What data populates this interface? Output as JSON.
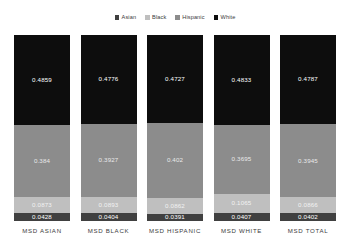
{
  "legend": {
    "position": "top-center",
    "items": [
      {
        "label": "Asian",
        "color": "#404040"
      },
      {
        "label": "Black",
        "color": "#bfbfbf"
      },
      {
        "label": "Hispanic",
        "color": "#8c8c8c"
      },
      {
        "label": "White",
        "color": "#0d0d0d"
      }
    ]
  },
  "chart_data": {
    "type": "bar",
    "subtype": "stacked-column",
    "title": "",
    "xlabel": "",
    "ylabel": "",
    "ylim": [
      0,
      1
    ],
    "grid": false,
    "stack_order_bottom_to_top": [
      "Asian",
      "Black",
      "Hispanic",
      "White"
    ],
    "categories": [
      "MSD ASIAN",
      "MSD BLACK",
      "MSD HISPANIC",
      "MSD WHITE",
      "MSD TOTAL"
    ],
    "series": [
      {
        "name": "White",
        "color": "#0d0d0d",
        "values": [
          0.4859,
          0.4776,
          0.4727,
          0.4833,
          0.4787
        ]
      },
      {
        "name": "Hispanic",
        "color": "#8c8c8c",
        "values": [
          0.384,
          0.3927,
          0.402,
          0.3695,
          0.3945
        ]
      },
      {
        "name": "Black",
        "color": "#bfbfbf",
        "values": [
          0.0873,
          0.0893,
          0.0862,
          0.1065,
          0.0866
        ]
      },
      {
        "name": "Asian",
        "color": "#404040",
        "values": [
          0.0428,
          0.0404,
          0.0391,
          0.0407,
          0.0402
        ]
      }
    ],
    "bars": [
      {
        "category": "MSD ASIAN",
        "segments": [
          {
            "series": "White",
            "value": 0.4859,
            "label": "0.4859",
            "color": "#0d0d0d"
          },
          {
            "series": "Hispanic",
            "value": 0.384,
            "label": "0.384",
            "color": "#8c8c8c"
          },
          {
            "series": "Black",
            "value": 0.0873,
            "label": "0.0873",
            "color": "#bfbfbf"
          },
          {
            "series": "Asian",
            "value": 0.0428,
            "label": "0.0428",
            "color": "#404040"
          }
        ]
      },
      {
        "category": "MSD BLACK",
        "segments": [
          {
            "series": "White",
            "value": 0.4776,
            "label": "0.4776",
            "color": "#0d0d0d"
          },
          {
            "series": "Hispanic",
            "value": 0.3927,
            "label": "0.3927",
            "color": "#8c8c8c"
          },
          {
            "series": "Black",
            "value": 0.0893,
            "label": "0.0893",
            "color": "#bfbfbf"
          },
          {
            "series": "Asian",
            "value": 0.0404,
            "label": "0.0404",
            "color": "#404040"
          }
        ]
      },
      {
        "category": "MSD HISPANIC",
        "segments": [
          {
            "series": "White",
            "value": 0.4727,
            "label": "0.4727",
            "color": "#0d0d0d"
          },
          {
            "series": "Hispanic",
            "value": 0.402,
            "label": "0.402",
            "color": "#8c8c8c"
          },
          {
            "series": "Black",
            "value": 0.0862,
            "label": "0.0862",
            "color": "#bfbfbf"
          },
          {
            "series": "Asian",
            "value": 0.0391,
            "label": "0.0391",
            "color": "#404040"
          }
        ]
      },
      {
        "category": "MSD WHITE",
        "segments": [
          {
            "series": "White",
            "value": 0.4833,
            "label": "0.4833",
            "color": "#0d0d0d"
          },
          {
            "series": "Hispanic",
            "value": 0.3695,
            "label": "0.3695",
            "color": "#8c8c8c"
          },
          {
            "series": "Black",
            "value": 0.1065,
            "label": "0.1065",
            "color": "#bfbfbf"
          },
          {
            "series": "Asian",
            "value": 0.0407,
            "label": "0.0407",
            "color": "#404040"
          }
        ]
      },
      {
        "category": "MSD TOTAL",
        "segments": [
          {
            "series": "White",
            "value": 0.4787,
            "label": "0.4787",
            "color": "#0d0d0d"
          },
          {
            "series": "Hispanic",
            "value": 0.3945,
            "label": "0.3945",
            "color": "#8c8c8c"
          },
          {
            "series": "Black",
            "value": 0.0866,
            "label": "0.0866",
            "color": "#bfbfbf"
          },
          {
            "series": "Asian",
            "value": 0.0402,
            "label": "0.0402",
            "color": "#404040"
          }
        ]
      }
    ]
  }
}
